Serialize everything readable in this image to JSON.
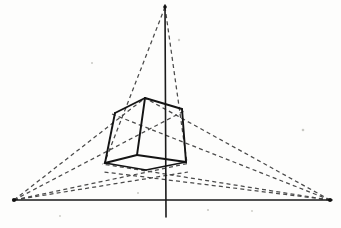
{
  "figure": {
    "canvas": {
      "width": 341,
      "height": 228,
      "background": "#fdfdfc"
    },
    "colors": {
      "axis": "#1a1a1a",
      "construction": "#4a4a4a",
      "cube_edge": "#141414",
      "paper": "#fdfdfc"
    },
    "vanishing_points": [
      {
        "name": "left-vanishing-point",
        "label": "VP left",
        "x": 14,
        "y": 200
      },
      {
        "name": "right-vanishing-point",
        "label": "VP right",
        "x": 330,
        "y": 200
      },
      {
        "name": "top-vanishing-point",
        "label": "VP vertical",
        "x": 165,
        "y": 7
      }
    ],
    "axes": [
      {
        "name": "horizon-axis",
        "label": "horizon line",
        "x1": 14,
        "y1": 200,
        "x2": 332,
        "y2": 200
      },
      {
        "name": "vertical-axis",
        "label": "vertical axis",
        "x1": 165,
        "y1": 5,
        "x2": 166,
        "y2": 217
      }
    ],
    "cube": {
      "label": "cube",
      "vertices": {
        "top_front": {
          "x": 145,
          "y": 98
        },
        "top_left": {
          "x": 115,
          "y": 113
        },
        "top_right": {
          "x": 182,
          "y": 109
        },
        "top_back": {
          "x": 152,
          "y": 124
        },
        "bottom_front": {
          "x": 137,
          "y": 155
        },
        "bottom_left": {
          "x": 105,
          "y": 163
        },
        "bottom_right": {
          "x": 186,
          "y": 162
        },
        "bottom_back": {
          "x": 146,
          "y": 170
        }
      },
      "edges": [
        {
          "name": "edge-top-front-to-top-left",
          "from": "top_front",
          "to": "top_left",
          "style": "solid"
        },
        {
          "name": "edge-top-front-to-top-right",
          "from": "top_front",
          "to": "top_right",
          "style": "solid"
        },
        {
          "name": "edge-top-front-to-bottom-front",
          "from": "top_front",
          "to": "bottom_front",
          "style": "solid"
        },
        {
          "name": "edge-top-left-to-bottom-left",
          "from": "top_left",
          "to": "bottom_left",
          "style": "solid"
        },
        {
          "name": "edge-top-right-to-bottom-right",
          "from": "top_right",
          "to": "bottom_right",
          "style": "solid"
        },
        {
          "name": "edge-bottom-front-to-bottom-left",
          "from": "bottom_front",
          "to": "bottom_left",
          "style": "solid"
        },
        {
          "name": "edge-bottom-front-to-bottom-right",
          "from": "bottom_front",
          "to": "bottom_right",
          "style": "solid"
        },
        {
          "name": "edge-bottom-left-to-bottom-back",
          "from": "bottom_left",
          "to": "bottom_back",
          "style": "solid"
        },
        {
          "name": "edge-bottom-right-to-bottom-back",
          "from": "bottom_right",
          "to": "bottom_back",
          "style": "solid"
        }
      ]
    },
    "construction_lines": [
      {
        "name": "construction-left-vp-to-top-front",
        "x1": 14,
        "y1": 200,
        "x2": 145,
        "y2": 98
      },
      {
        "name": "construction-left-vp-to-top-right",
        "x1": 14,
        "y1": 200,
        "x2": 186,
        "y2": 110
      },
      {
        "name": "construction-left-vp-to-bottom-right",
        "x1": 14,
        "y1": 200,
        "x2": 190,
        "y2": 163
      },
      {
        "name": "construction-left-vp-to-bottom-back",
        "x1": 14,
        "y1": 200,
        "x2": 188,
        "y2": 172
      },
      {
        "name": "construction-right-vp-to-top-front",
        "x1": 330,
        "y1": 200,
        "x2": 145,
        "y2": 98
      },
      {
        "name": "construction-right-vp-to-top-left",
        "x1": 330,
        "y1": 200,
        "x2": 112,
        "y2": 114
      },
      {
        "name": "construction-right-vp-to-bottom-left",
        "x1": 330,
        "y1": 200,
        "x2": 102,
        "y2": 164
      },
      {
        "name": "construction-right-vp-to-bottom-back",
        "x1": 330,
        "y1": 200,
        "x2": 104,
        "y2": 172
      },
      {
        "name": "construction-top-vp-to-bottom-left",
        "x1": 165,
        "y1": 7,
        "x2": 104,
        "y2": 164
      },
      {
        "name": "construction-top-vp-to-bottom-right",
        "x1": 165,
        "y1": 7,
        "x2": 187,
        "y2": 163
      }
    ],
    "specks": [
      {
        "x": 179,
        "y": 40,
        "r": 1.2
      },
      {
        "x": 92,
        "y": 63,
        "r": 1.0
      },
      {
        "x": 303,
        "y": 130,
        "r": 1.3
      },
      {
        "x": 138,
        "y": 193,
        "r": 1.0
      },
      {
        "x": 208,
        "y": 210,
        "r": 1.1
      },
      {
        "x": 252,
        "y": 211,
        "r": 0.9
      },
      {
        "x": 60,
        "y": 216,
        "r": 0.9
      }
    ]
  }
}
